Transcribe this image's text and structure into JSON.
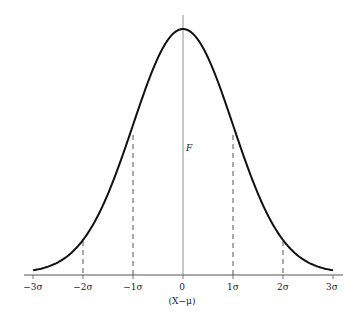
{
  "figure": {
    "center_label": "F",
    "x_axis_label": "(X−μ)",
    "ticks": [
      {
        "label": "−3σ",
        "value": -3
      },
      {
        "label": "−2σ",
        "value": -2
      },
      {
        "label": "−1σ",
        "value": -1
      },
      {
        "label": "0",
        "value": 0
      },
      {
        "label": "1σ",
        "value": 1
      },
      {
        "label": "2σ",
        "value": 2
      },
      {
        "label": "3σ",
        "value": 3
      }
    ],
    "dashed_lines_at": [
      -2,
      -1,
      1,
      2
    ],
    "colors": {
      "curve": "#111111",
      "axis": "#555555",
      "dashed": "#444444"
    }
  }
}
